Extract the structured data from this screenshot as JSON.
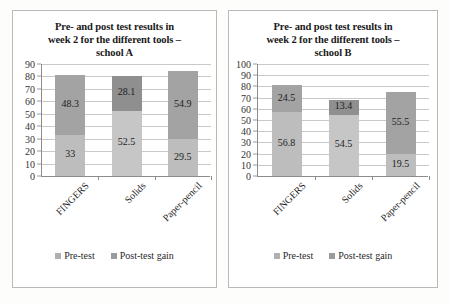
{
  "page": {
    "background": "#fdfdfc",
    "panel_border_color": "#b9b9b9"
  },
  "colors": {
    "pre_test": "#bdbdbd",
    "post_test_gain": "#a3a3a3",
    "gridline": "#c9c9c9",
    "axis": "#8c8c8c",
    "text": "#1a1a1a"
  },
  "legend": {
    "pre_label": "Pre-test",
    "post_label": "Post-test gain"
  },
  "chart_data": [
    {
      "type": "bar",
      "id": "school-a",
      "title": "Pre- and post test results in week 2 for the different tools – school A",
      "title_lines": [
        "Pre- and post test results in",
        "week 2 for the different tools –",
        "school A"
      ],
      "stacked": true,
      "categories": [
        "FINGERS",
        "Solids",
        "Paper-pencil"
      ],
      "series": [
        {
          "name": "Pre-test",
          "values": [
            33,
            52.5,
            29.5
          ],
          "labels": [
            "33",
            "52.5",
            "29.5"
          ]
        },
        {
          "name": "Post-test gain",
          "values": [
            48.3,
            28.1,
            54.9
          ],
          "labels": [
            "48.3",
            "28.1",
            "54.9"
          ]
        }
      ],
      "totals": [
        81.3,
        80.6,
        84.4
      ],
      "xlabel": "",
      "ylabel": "",
      "ylim": [
        0,
        90
      ],
      "ytick_step": 10,
      "yticks": [
        0,
        10,
        20,
        30,
        40,
        50,
        60,
        70,
        80,
        90
      ],
      "grid": true,
      "legend_position": "bottom"
    },
    {
      "type": "bar",
      "id": "school-b",
      "title": "Pre- and post test results in week 2 for the different tools – school B",
      "title_lines": [
        "Pre- and post test results in",
        "week 2 for the different tools –",
        "school B"
      ],
      "stacked": true,
      "categories": [
        "FINGERS",
        "Solids",
        "Paper-pencil"
      ],
      "series": [
        {
          "name": "Pre-test",
          "values": [
            56.8,
            54.5,
            19.5
          ],
          "labels": [
            "56.8",
            "54.5",
            "19.5"
          ]
        },
        {
          "name": "Post-test gain",
          "values": [
            24.5,
            13.4,
            55.5
          ],
          "labels": [
            "24.5",
            "13.4",
            "55.5"
          ]
        }
      ],
      "totals": [
        81.3,
        67.9,
        75.0
      ],
      "xlabel": "",
      "ylabel": "",
      "ylim": [
        0,
        100
      ],
      "ytick_step": 10,
      "yticks": [
        0,
        10,
        20,
        30,
        40,
        50,
        60,
        70,
        80,
        90,
        100
      ],
      "grid": true,
      "legend_position": "bottom"
    }
  ]
}
